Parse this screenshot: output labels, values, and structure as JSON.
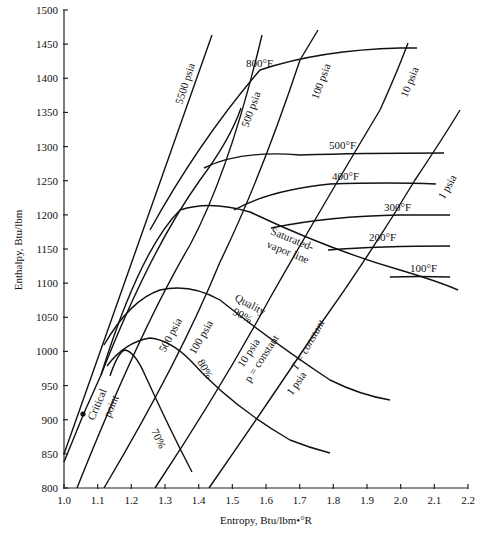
{
  "chart_data": {
    "type": "line",
    "title": "",
    "xlabel": "Entropy, Btu/lbm•°R",
    "ylabel": "Enthalpy, Btu/lbm",
    "xlim": [
      1.0,
      2.2
    ],
    "ylim": [
      800,
      1500
    ],
    "xticks": [
      "1.0",
      "1.1",
      "1.2",
      "1.3",
      "1.4",
      "1.5",
      "1.6",
      "1.7",
      "1.8",
      "1.9",
      "2.0",
      "2.1",
      "2.2"
    ],
    "yticks": [
      "800",
      "850",
      "900",
      "950",
      "1000",
      "1050",
      "1100",
      "1150",
      "1200",
      "1250",
      "1300",
      "1350",
      "1400",
      "1450",
      "1500"
    ],
    "grid": false,
    "series": [
      {
        "name": "5500 psia",
        "kind": "constant-pressure",
        "points": [
          [
            1.0,
            850
          ],
          [
            1.44,
            1460
          ]
        ]
      },
      {
        "name": "Critical-point line",
        "kind": "constant-pressure",
        "points": [
          [
            1.0,
            838
          ],
          [
            1.06,
            905
          ],
          [
            1.11,
            960
          ],
          [
            1.28,
            1170
          ],
          [
            1.49,
            1395
          ],
          [
            1.54,
            1430
          ]
        ]
      },
      {
        "name": "500 psia",
        "kind": "constant-pressure",
        "points": [
          [
            1.04,
            800
          ],
          [
            1.35,
            1160
          ],
          [
            1.6,
            1460
          ]
        ]
      },
      {
        "name": "100 psia",
        "kind": "constant-pressure",
        "points": [
          [
            1.12,
            800
          ],
          [
            1.46,
            1200
          ],
          [
            1.7,
            1470
          ]
        ]
      },
      {
        "name": "10 psia",
        "kind": "constant-pressure",
        "points": [
          [
            1.27,
            800
          ],
          [
            1.62,
            1150
          ],
          [
            1.95,
            1450
          ]
        ]
      },
      {
        "name": "1 psia",
        "kind": "constant-pressure",
        "points": [
          [
            1.43,
            800
          ],
          [
            1.76,
            1110
          ],
          [
            2.17,
            1250
          ]
        ]
      },
      {
        "name": "800°F",
        "kind": "constant-temperature",
        "points": [
          [
            1.27,
            1200
          ],
          [
            1.5,
            1390
          ],
          [
            1.7,
            1430
          ],
          [
            2.05,
            1437
          ]
        ]
      },
      {
        "name": "500°F",
        "kind": "constant-temperature",
        "points": [
          [
            1.43,
            1230
          ],
          [
            1.6,
            1270
          ],
          [
            1.85,
            1288
          ],
          [
            2.15,
            1290
          ]
        ]
      },
      {
        "name": "400°F",
        "kind": "constant-temperature",
        "points": [
          [
            1.52,
            1205
          ],
          [
            1.7,
            1237
          ],
          [
            1.9,
            1243
          ],
          [
            2.13,
            1243
          ]
        ]
      },
      {
        "name": "300°F",
        "kind": "constant-temperature",
        "points": [
          [
            1.63,
            1180
          ],
          [
            1.85,
            1195
          ],
          [
            2.15,
            1200
          ]
        ]
      },
      {
        "name": "200°F",
        "kind": "constant-temperature",
        "points": [
          [
            1.75,
            1146
          ],
          [
            1.95,
            1152
          ],
          [
            2.15,
            1153
          ]
        ]
      },
      {
        "name": "100°F",
        "kind": "constant-temperature",
        "points": [
          [
            1.98,
            1105
          ],
          [
            2.15,
            1108
          ]
        ]
      },
      {
        "name": "Saturated-vapor line",
        "kind": "saturation",
        "points": [
          [
            1.11,
            1010
          ],
          [
            1.2,
            1150
          ],
          [
            1.35,
            1205
          ],
          [
            1.55,
            1185
          ],
          [
            1.78,
            1145
          ],
          [
            2.0,
            1105
          ],
          [
            2.17,
            1080
          ]
        ]
      },
      {
        "name": "Quality 90%",
        "kind": "constant-quality",
        "points": [
          [
            1.14,
            1030
          ],
          [
            1.3,
            1130
          ],
          [
            1.5,
            1080
          ],
          [
            1.7,
            1010
          ],
          [
            1.9,
            970
          ]
        ]
      },
      {
        "name": "80%",
        "kind": "constant-quality",
        "points": [
          [
            1.15,
            990
          ],
          [
            1.28,
            1060
          ],
          [
            1.43,
            1000
          ],
          [
            1.6,
            910
          ],
          [
            1.75,
            862
          ]
        ]
      },
      {
        "name": "70%",
        "kind": "constant-quality",
        "points": [
          [
            1.16,
            985
          ],
          [
            1.17,
            1000
          ],
          [
            1.27,
            950
          ],
          [
            1.38,
            818
          ]
        ]
      }
    ],
    "annotations": [
      "Critical point",
      "Saturated-vapor line",
      "Quality 90%",
      "80%",
      "70%",
      "T = constant",
      "p = constant",
      "5500 psia",
      "500 psia",
      "100 psia",
      "10 psia",
      "1 psia",
      "800°F",
      "500°F",
      "400°F",
      "300°F",
      "200°F",
      "100°F"
    ]
  },
  "labels": {
    "xlabel": "Entropy, Btu/lbm•°R",
    "ylabel": "Enthalpy, Btu/lbm",
    "critical": "Critical",
    "point": "point",
    "p5500": "5500 psia",
    "p500a": "500 psia",
    "p500b": "500 psia",
    "p100a": "100 psia",
    "p100b": "100 psia",
    "p10a": "10 psia",
    "p10b": "10 psia",
    "p1a": "1 psia",
    "p1b": "1 psia",
    "t800": "800°F",
    "t500": "500°F",
    "t400": "400°F",
    "t300": "300°F",
    "t200": "200°F",
    "t100": "100°F",
    "sat1": "Saturated-",
    "sat2": "vapor line",
    "quality": "Quality",
    "q90": "90%",
    "q80": "80%",
    "q70": "70%",
    "tconst": "T = constant",
    "pconst": "p = constant"
  }
}
